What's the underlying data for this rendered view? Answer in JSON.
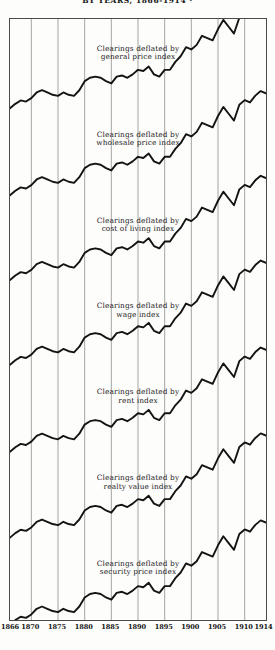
{
  "figure": {
    "title_line": "BY YEARS, 1866-1914 ·",
    "ink_color": "#141414",
    "grid_color": "#9a9a9a",
    "frame_color": "#4a4a4a",
    "background_color": "#fdfdfb"
  },
  "chart_data": {
    "type": "line",
    "title": "BY YEARS, 1866-1914 ·",
    "xlabel": "",
    "ylabel": "",
    "grid": true,
    "legend_position": "inline-annotation",
    "xlim": [
      1866,
      1914
    ],
    "x_ticks": [
      "1866",
      "1870",
      "1875",
      "1880",
      "1885",
      "1890",
      "1895",
      "1900",
      "1905",
      "1910",
      "1914"
    ],
    "x_tick_values": [
      1866,
      1870,
      1875,
      1880,
      1885,
      1890,
      1895,
      1900,
      1905,
      1910,
      1914
    ],
    "x": [
      1866,
      1867,
      1868,
      1869,
      1870,
      1871,
      1872,
      1873,
      1874,
      1875,
      1876,
      1877,
      1878,
      1879,
      1880,
      1881,
      1882,
      1883,
      1884,
      1885,
      1886,
      1887,
      1888,
      1889,
      1890,
      1891,
      1892,
      1893,
      1894,
      1895,
      1896,
      1897,
      1898,
      1899,
      1900,
      1901,
      1902,
      1903,
      1904,
      1905,
      1906,
      1907,
      1908,
      1909,
      1910,
      1911,
      1912,
      1913,
      1914
    ],
    "note": "Seven stacked panels; each plots an index of bank clearings deflated by a different price/value index. Values are relative index levels read off each panel's own vertical scale (0 = panel baseline, 100 = panel top).",
    "series": [
      {
        "name": "Clearings deflated by general price index",
        "label_line1": "Clearings deflated by",
        "label_line2": "general price index",
        "panel": 1,
        "values": [
          6,
          10,
          13,
          12,
          15,
          20,
          22,
          20,
          18,
          17,
          20,
          18,
          17,
          22,
          30,
          33,
          34,
          33,
          30,
          28,
          34,
          35,
          33,
          36,
          40,
          39,
          43,
          36,
          34,
          40,
          40,
          47,
          52,
          60,
          58,
          62,
          70,
          68,
          66,
          76,
          84,
          78,
          72,
          86,
          90,
          88,
          94,
          98,
          96
        ]
      },
      {
        "name": "Clearings deflated by wholesale price index",
        "label_line1": "Clearings deflated by",
        "label_line2": "wholesale price index",
        "panel": 2,
        "values": [
          5,
          9,
          12,
          11,
          14,
          19,
          21,
          19,
          17,
          16,
          19,
          17,
          16,
          21,
          29,
          32,
          33,
          32,
          29,
          27,
          33,
          34,
          32,
          35,
          39,
          38,
          42,
          35,
          33,
          39,
          39,
          46,
          51,
          59,
          57,
          61,
          69,
          67,
          65,
          75,
          83,
          77,
          71,
          85,
          89,
          87,
          93,
          97,
          95
        ]
      },
      {
        "name": "Clearings deflated by cost of living index",
        "label_line1": "Clearings deflated by",
        "label_line2": "cost of living index",
        "panel": 3,
        "values": [
          6,
          10,
          13,
          12,
          15,
          20,
          22,
          20,
          18,
          17,
          20,
          18,
          17,
          22,
          30,
          33,
          34,
          33,
          30,
          28,
          34,
          35,
          33,
          36,
          40,
          39,
          43,
          36,
          34,
          40,
          40,
          47,
          52,
          60,
          58,
          62,
          70,
          68,
          66,
          76,
          84,
          78,
          72,
          86,
          90,
          88,
          94,
          98,
          96
        ]
      },
      {
        "name": "Clearings deflated by wage index",
        "label_line1": "Clearings deflated by",
        "label_line2": "wage index",
        "panel": 4,
        "values": [
          7,
          11,
          14,
          13,
          16,
          21,
          23,
          21,
          19,
          18,
          21,
          19,
          18,
          23,
          31,
          34,
          35,
          34,
          31,
          29,
          35,
          36,
          34,
          37,
          41,
          40,
          44,
          37,
          35,
          41,
          41,
          48,
          53,
          61,
          59,
          63,
          71,
          69,
          67,
          77,
          85,
          79,
          73,
          87,
          91,
          89,
          95,
          99,
          97
        ]
      },
      {
        "name": "Clearings deflated by rent index",
        "label_line1": "Clearings deflated by",
        "label_line2": "rent index",
        "panel": 5,
        "values": [
          6,
          10,
          13,
          12,
          15,
          20,
          22,
          20,
          18,
          17,
          20,
          18,
          17,
          22,
          30,
          33,
          34,
          33,
          30,
          28,
          34,
          35,
          33,
          36,
          40,
          39,
          43,
          36,
          34,
          40,
          40,
          47,
          52,
          60,
          58,
          62,
          70,
          68,
          66,
          76,
          84,
          78,
          72,
          86,
          90,
          88,
          94,
          98,
          96
        ]
      },
      {
        "name": "Clearings deflated by realty value index",
        "label_line1": "Clearings deflated by",
        "label_line2": "realty value index",
        "panel": 6,
        "values": [
          6,
          10,
          13,
          12,
          15,
          20,
          22,
          20,
          18,
          17,
          20,
          18,
          17,
          22,
          30,
          33,
          34,
          33,
          30,
          28,
          34,
          35,
          33,
          36,
          40,
          39,
          43,
          36,
          34,
          40,
          40,
          47,
          52,
          60,
          58,
          62,
          70,
          68,
          66,
          76,
          84,
          78,
          72,
          86,
          90,
          88,
          94,
          98,
          96
        ]
      },
      {
        "name": "Clearings deflated by security price index",
        "label_line1": "Clearings deflated by",
        "label_line2": "security price index",
        "panel": 7,
        "values": [
          5,
          9,
          12,
          11,
          14,
          19,
          21,
          19,
          17,
          16,
          19,
          17,
          16,
          21,
          29,
          32,
          33,
          32,
          29,
          27,
          33,
          34,
          32,
          35,
          39,
          38,
          42,
          35,
          33,
          39,
          39,
          46,
          51,
          59,
          57,
          61,
          69,
          67,
          65,
          75,
          83,
          77,
          71,
          85,
          89,
          87,
          93,
          97,
          95
        ]
      }
    ]
  },
  "x_axis": {
    "ticks": [
      {
        "label": "1866",
        "pos": 0
      },
      {
        "label": "1870",
        "pos": 8.33
      },
      {
        "label": "1875",
        "pos": 18.75
      },
      {
        "label": "1880",
        "pos": 29.17
      },
      {
        "label": "1885",
        "pos": 39.58
      },
      {
        "label": "1890",
        "pos": 50.0
      },
      {
        "label": "1895",
        "pos": 60.42
      },
      {
        "label": "1900",
        "pos": 70.83
      },
      {
        "label": "1905",
        "pos": 81.25
      },
      {
        "label": "1910",
        "pos": 91.67
      },
      {
        "label": "1914",
        "pos": 100
      }
    ]
  }
}
